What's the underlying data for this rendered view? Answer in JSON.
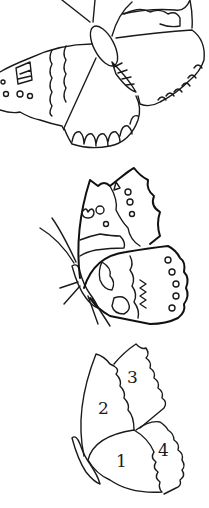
{
  "page": {
    "background": "#ffffff",
    "line_color": "#1a1a1a"
  },
  "figures": [
    {
      "name": "butterfly-open-wings",
      "position": "top"
    },
    {
      "name": "butterfly-side-view-patterned",
      "position": "middle"
    },
    {
      "name": "butterfly-side-view-numbered",
      "position": "bottom",
      "region_labels": [
        "1",
        "2",
        "3",
        "4"
      ]
    }
  ]
}
